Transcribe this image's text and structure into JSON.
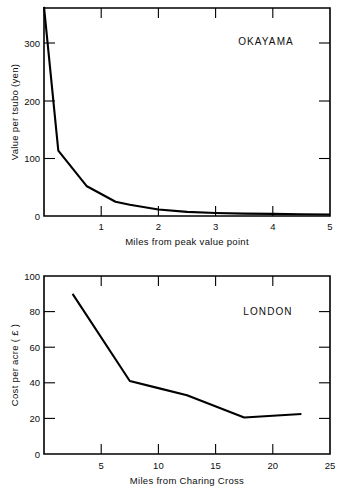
{
  "figure": {
    "background_color": "#ffffff",
    "line_color": "#000000",
    "text_color": "#0d0d0d"
  },
  "chart_data": [
    {
      "type": "line",
      "title": "OKAYAMA",
      "xlabel": "Miles from peak value point",
      "ylabel": "Value per tsubo (yen)",
      "xlim": [
        0,
        5
      ],
      "ylim": [
        0,
        350
      ],
      "xticks": [
        0,
        1,
        2,
        3,
        4,
        5
      ],
      "xtick_labels": [
        "",
        "1",
        "2",
        "3",
        "4",
        "5"
      ],
      "yticks": [
        0,
        100,
        200,
        300
      ],
      "ytick_labels": [
        "0",
        "100",
        "200",
        "300"
      ],
      "grid": false,
      "legend": "none",
      "title_position": "top-right",
      "x": [
        0.0,
        0.25,
        0.75,
        1.25,
        1.5,
        2.0,
        2.5,
        3.0,
        3.5,
        4.0,
        4.5,
        5.0
      ],
      "values": [
        352,
        110,
        50,
        24,
        19,
        11,
        7,
        5,
        4,
        3.5,
        3,
        2.5
      ],
      "series": [
        {
          "name": "Okayama land value",
          "values": [
            352,
            110,
            50,
            24,
            19,
            11,
            7,
            5,
            4,
            3.5,
            3,
            2.5
          ]
        }
      ]
    },
    {
      "type": "line",
      "title": "LONDON",
      "xlabel": "Miles from Charing Cross",
      "ylabel": "Cost per acre ( £ )",
      "xlim": [
        0,
        25
      ],
      "ylim": [
        0,
        100
      ],
      "xticks": [
        0,
        5,
        10,
        15,
        20,
        25
      ],
      "xtick_labels": [
        "",
        "5",
        "10",
        "15",
        "20",
        "25"
      ],
      "yticks": [
        0,
        20,
        40,
        60,
        80,
        100
      ],
      "ytick_labels": [
        "0",
        "20",
        "40",
        "60",
        "80",
        "100"
      ],
      "grid": false,
      "legend": "none",
      "title_position": "top-right",
      "x": [
        2.5,
        7.5,
        10.0,
        12.5,
        17.5,
        22.5
      ],
      "values": [
        90,
        41,
        37,
        33,
        20.5,
        22.5
      ],
      "series": [
        {
          "name": "London land cost",
          "values": [
            90,
            41,
            37,
            33,
            20.5,
            22.5
          ]
        }
      ]
    }
  ],
  "top_chart": {
    "title": "OKAYAMA",
    "xlabel": "Miles from peak value point",
    "ylabel": "Value per tsubo (yen)",
    "ytick_labels": [
      "300",
      "200",
      "100",
      "0"
    ],
    "xtick_labels": [
      "1",
      "2",
      "3",
      "4",
      "5"
    ]
  },
  "bottom_chart": {
    "title": "LONDON",
    "xlabel": "Miles from Charing Cross",
    "ylabel": "Cost per acre ( £ )",
    "ytick_labels": [
      "100",
      "80",
      "60",
      "40",
      "20",
      "0"
    ],
    "xtick_labels": [
      "5",
      "10",
      "15",
      "20",
      "25"
    ]
  }
}
